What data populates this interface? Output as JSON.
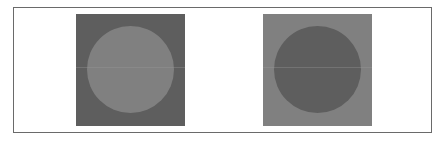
{
  "figure": {
    "frame_border_color": "#6a6a6a",
    "background_color": "#ffffff",
    "panels": [
      {
        "name": "left",
        "square_color": "#5e5e5e",
        "circle_color": "#808080",
        "line_color": "#9a9a9a"
      },
      {
        "name": "right",
        "square_color": "#808080",
        "circle_color": "#5e5e5e",
        "line_color": "#9a9a9a"
      }
    ]
  }
}
